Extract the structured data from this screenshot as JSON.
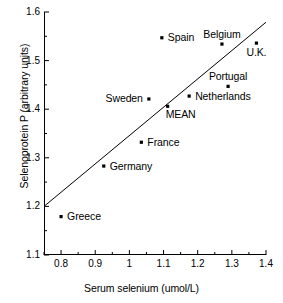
{
  "chart_data": {
    "type": "scatter",
    "title": "",
    "xlabel": "Serum selenium (umol/L)",
    "ylabel": "Selenoprotein P (arbitrary units)",
    "xlim": [
      0.75,
      1.4
    ],
    "ylim": [
      1.1,
      1.6
    ],
    "xticks": [
      "0.8",
      "0.9",
      "1",
      "1.1",
      "1.2",
      "1.3",
      "1.4"
    ],
    "xtick_values": [
      0.8,
      0.9,
      1.0,
      1.1,
      1.2,
      1.3,
      1.4
    ],
    "yticks": [
      "1.1",
      "1.2",
      "1.3",
      "1.4",
      "1.5",
      "1.6"
    ],
    "ytick_values": [
      1.1,
      1.2,
      1.3,
      1.4,
      1.5,
      1.6
    ],
    "minor_ticks": true,
    "grid": false,
    "legend": false,
    "marker": "square-dot",
    "marker_color": "#000000",
    "line_color": "#000000",
    "points": [
      {
        "label": "Greece",
        "x": 0.8,
        "y": 1.179,
        "label_pos": "right"
      },
      {
        "label": "Germany",
        "x": 0.925,
        "y": 1.283,
        "label_pos": "right"
      },
      {
        "label": "France",
        "x": 1.035,
        "y": 1.332,
        "label_pos": "right"
      },
      {
        "label": "Sweden",
        "x": 1.057,
        "y": 1.421,
        "label_pos": "left"
      },
      {
        "label": "MEAN",
        "x": 1.112,
        "y": 1.406,
        "label_pos": "below-right"
      },
      {
        "label": "Spain",
        "x": 1.095,
        "y": 1.547,
        "label_pos": "right"
      },
      {
        "label": "Netherlands",
        "x": 1.175,
        "y": 1.427,
        "label_pos": "right"
      },
      {
        "label": "Belgium",
        "x": 1.271,
        "y": 1.534,
        "label_pos": "above"
      },
      {
        "label": "Portugal",
        "x": 1.289,
        "y": 1.447,
        "label_pos": "above"
      },
      {
        "label": "U.K.",
        "x": 1.372,
        "y": 1.536,
        "label_pos": "below"
      }
    ],
    "trendline": {
      "type": "linear",
      "x_start": 0.75,
      "y_start": 1.2,
      "x_end": 1.4,
      "y_end": 1.579
    }
  }
}
